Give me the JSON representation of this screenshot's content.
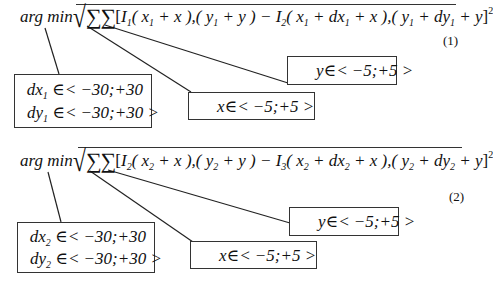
{
  "equations": [
    {
      "id": "1",
      "number_label": "(1)",
      "operator": "arg min",
      "sqrt": "√",
      "sums": "∑∑",
      "body_parts": {
        "open": "[",
        "I_a": "I",
        "I_a_sub": "1",
        "arg1": "( x",
        "arg1_sub": "1",
        "arg1_rest": " + x ),( y",
        "arg2_sub": "1",
        "arg2_rest": " + y ) − ",
        "I_b": "I",
        "I_b_sub": "2",
        "arg3": "( x",
        "arg3_sub": "1",
        "arg3_mid": " + dx",
        "arg3_dsub": "1",
        "arg3_rest": " + x ),( y",
        "arg4_sub": "1",
        "arg4_mid": " + dy",
        "arg4_dsub": "1",
        "arg4_rest": " + y",
        "close": "]",
        "power": "2"
      },
      "annotations": {
        "displacement_box": {
          "line1_var": "dx",
          "line1_sub": "1",
          "line1_range": " ∈< −30;+30",
          "line2_var": "dy",
          "line2_sub": "1",
          "line2_range": " ∈< −30;+30 >"
        },
        "x_box": {
          "text": "x∈< −5;+5 >"
        },
        "y_box": {
          "text": "y∈< −5;+5 >"
        }
      }
    },
    {
      "id": "2",
      "number_label": "(2)",
      "operator": "arg min",
      "sqrt": "√",
      "sums": "∑∑",
      "body_parts": {
        "open": "[",
        "I_a": "I",
        "I_a_sub": "2",
        "arg1": "( x",
        "arg1_sub": "2",
        "arg1_rest": " + x ),( y",
        "arg2_sub": "2",
        "arg2_rest": " + y ) − ",
        "I_b": "I",
        "I_b_sub": "3",
        "arg3": "( x",
        "arg3_sub": "2",
        "arg3_mid": " + dx",
        "arg3_dsub": "2",
        "arg3_rest": " + x ),( y",
        "arg4_sub": "2",
        "arg4_mid": " + dy",
        "arg4_dsub": "2",
        "arg4_rest": " + y",
        "close": "]",
        "power": "2"
      },
      "annotations": {
        "displacement_box": {
          "line1_var": "dx",
          "line1_sub": "2",
          "line1_range": " ∈< −30;+30",
          "line2_var": "dy",
          "line2_sub": "2",
          "line2_range": " ∈< −30;+30 >"
        },
        "x_box": {
          "text": "x∈< −5;+5 >"
        },
        "y_box": {
          "text": "y∈< −5;+5 >"
        }
      }
    }
  ]
}
